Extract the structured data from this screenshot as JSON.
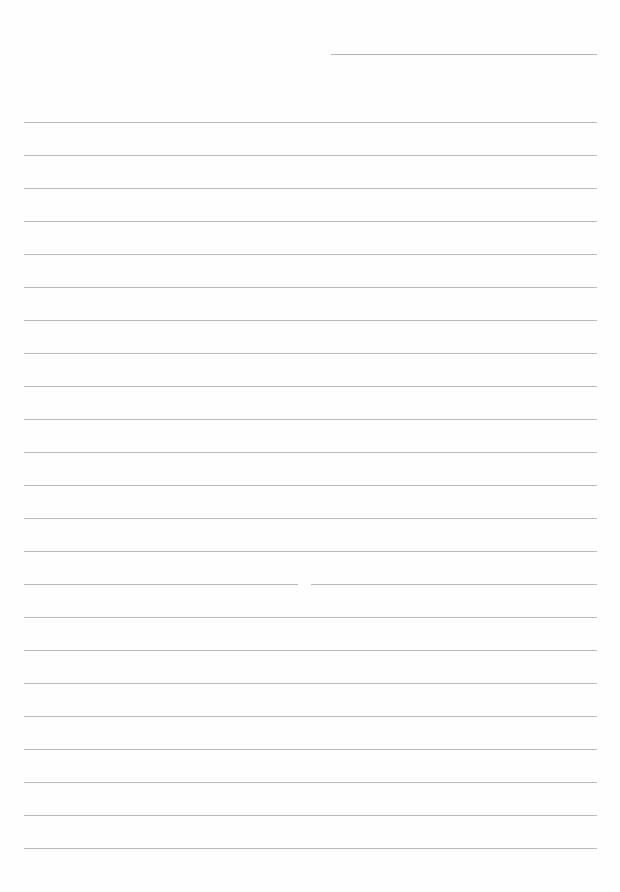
{
  "document": {
    "type": "lined-paper",
    "background_color": "#fefefe",
    "line_color": "#b9b9b9",
    "header_line": {
      "left": 331,
      "right": 597,
      "y": 54
    },
    "ruled_lines": {
      "count": 23,
      "first_y": 122,
      "spacing": 33,
      "left": 24,
      "right": 597
    },
    "gap": {
      "line_index": 14,
      "left": 298,
      "right": 311
    }
  }
}
